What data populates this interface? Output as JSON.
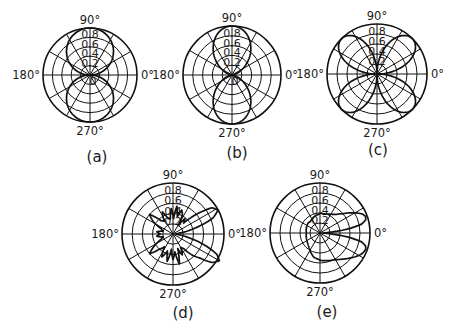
{
  "figure": {
    "panels": [
      "(a)",
      "(b)",
      "(c)",
      "(d)",
      "(e)"
    ]
  },
  "chart_data": [
    {
      "type": "polar-line",
      "caption": "(a)",
      "pattern": "dipole |sin θ| (two tangent circles, lobes at 90° and 270°)",
      "angle_ticks": [
        "0°",
        "90°",
        "180°",
        "270°"
      ],
      "radial_ticks": [
        0.2,
        0.4,
        0.6,
        0.8
      ],
      "center_label": "0",
      "rmax": 1.0,
      "grid": {
        "rings": [
          0.2,
          0.4,
          0.6,
          0.8,
          1.0
        ],
        "spokes_deg": 30
      },
      "layout": {
        "cx": 90,
        "cy": 75,
        "r": 47,
        "caption_x": 97,
        "caption_y": 162
      },
      "func": "abs_sin",
      "samples": {
        "theta_deg": [
          0,
          30,
          60,
          90,
          120,
          150,
          180,
          210,
          240,
          270,
          300,
          330
        ],
        "r": [
          0,
          0.5,
          0.87,
          1.0,
          0.87,
          0.5,
          0,
          0.5,
          0.87,
          1.0,
          0.87,
          0.5
        ]
      }
    },
    {
      "type": "polar-line",
      "caption": "(b)",
      "pattern": "dipole sin²θ (narrower lobes at 90° and 270°)",
      "angle_ticks": [
        "0°",
        "90°",
        "180°",
        "270°"
      ],
      "radial_ticks": [
        0.2,
        0.4,
        0.6,
        0.8
      ],
      "center_label": "0",
      "rmax": 1.0,
      "grid": {
        "rings": [
          0.2,
          0.4,
          0.6,
          0.8,
          1.0
        ],
        "spokes_deg": 30
      },
      "layout": {
        "cx": 232,
        "cy": 75,
        "r": 49,
        "caption_x": 237,
        "caption_y": 158
      },
      "func": "sin_sq",
      "samples": {
        "theta_deg": [
          0,
          30,
          60,
          90,
          120,
          150,
          180,
          210,
          240,
          270,
          300,
          330
        ],
        "r": [
          0,
          0.25,
          0.75,
          1.0,
          0.75,
          0.25,
          0,
          0.25,
          0.75,
          1.0,
          0.75,
          0.25
        ]
      }
    },
    {
      "type": "polar-line",
      "caption": "(c)",
      "pattern": "quadrupole |sin 2θ| (four lobes at 45°, 135°, 225°, 315°)",
      "angle_ticks": [
        "0°",
        "90°",
        "180°",
        "270°"
      ],
      "radial_ticks": [
        0.2,
        0.4,
        0.6,
        0.8
      ],
      "rmax": 1.0,
      "grid": {
        "rings": [
          0.2,
          0.4,
          0.6,
          0.8,
          1.0
        ],
        "spokes_deg": 30
      },
      "layout": {
        "cx": 377,
        "cy": 74,
        "r": 50,
        "caption_x": 378,
        "caption_y": 155
      },
      "func": "abs_sin2",
      "samples": {
        "theta_deg": [
          0,
          45,
          90,
          135,
          180,
          225,
          270,
          315
        ],
        "r": [
          0,
          1.0,
          0,
          1.0,
          0,
          1.0,
          0,
          1.0
        ]
      }
    },
    {
      "type": "polar-line",
      "caption": "(d)",
      "pattern": "two main lobes at about ±30°, spiky back sidelobes",
      "angle_ticks": [
        "0°",
        "90°",
        "180°",
        "270°"
      ],
      "radial_ticks": [
        0.2,
        0.4,
        0.6,
        0.8
      ],
      "rmax": 1.0,
      "grid": {
        "rings": [
          0.2,
          0.4,
          0.6,
          0.8,
          1.0
        ],
        "spokes_deg": 30
      },
      "layout": {
        "cx": 173,
        "cy": 234,
        "r": 51,
        "caption_x": 183,
        "caption_y": 318
      },
      "func": "points",
      "samples": {
        "theta_deg": [
          0,
          8,
          15,
          22,
          28,
          34,
          40,
          46,
          52,
          58,
          64,
          70,
          76,
          82,
          88,
          94,
          100,
          108,
          116,
          124,
          132,
          140,
          148,
          156,
          164,
          172,
          180,
          188,
          196,
          204,
          212,
          220,
          228,
          236,
          244,
          252,
          258,
          264,
          270,
          276,
          282,
          288,
          294,
          300,
          306,
          312,
          318,
          324,
          330,
          335,
          340,
          346,
          352,
          360
        ],
        "r": [
          0.05,
          0.12,
          0.45,
          0.85,
          1.0,
          0.92,
          0.6,
          0.3,
          0.38,
          0.2,
          0.42,
          0.5,
          0.35,
          0.55,
          0.3,
          0.5,
          0.3,
          0.32,
          0.48,
          0.3,
          0.35,
          0.6,
          0.45,
          0.25,
          0.2,
          0.32,
          0.25,
          0.32,
          0.2,
          0.25,
          0.42,
          0.6,
          0.4,
          0.3,
          0.5,
          0.35,
          0.55,
          0.3,
          0.5,
          0.35,
          0.6,
          0.3,
          0.45,
          0.3,
          0.35,
          0.55,
          0.7,
          0.95,
          1.05,
          0.95,
          0.7,
          0.35,
          0.12,
          0.05
        ]
      }
    },
    {
      "type": "polar-line",
      "caption": "(e)",
      "pattern": "two forward lobes at about ±20°, broad low back plateau",
      "angle_ticks": [
        "0°",
        "90°",
        "180°",
        "270°"
      ],
      "radial_ticks": [
        0.2,
        0.4,
        0.6,
        0.8
      ],
      "rmax": 1.0,
      "grid": {
        "rings": [
          0.2,
          0.4,
          0.6,
          0.8,
          1.0
        ],
        "spokes_deg": 30
      },
      "layout": {
        "cx": 320,
        "cy": 233,
        "r": 50,
        "caption_x": 327,
        "caption_y": 317
      },
      "func": "points",
      "samples": {
        "theta_deg": [
          0,
          4,
          8,
          12,
          16,
          20,
          24,
          28,
          34,
          40,
          48,
          56,
          64,
          72,
          80,
          88,
          96,
          104,
          112,
          120,
          130,
          140,
          150,
          160,
          170,
          180,
          190,
          200,
          210,
          220,
          230,
          240,
          248,
          256,
          264,
          272,
          280,
          288,
          296,
          304,
          312,
          320,
          326,
          332,
          336,
          340,
          344,
          348,
          352,
          356,
          360
        ],
        "r": [
          0.05,
          0.15,
          0.55,
          0.85,
          0.95,
          0.97,
          0.93,
          0.85,
          0.72,
          0.6,
          0.5,
          0.45,
          0.42,
          0.4,
          0.38,
          0.4,
          0.37,
          0.36,
          0.34,
          0.32,
          0.3,
          0.31,
          0.3,
          0.29,
          0.28,
          0.27,
          0.28,
          0.29,
          0.3,
          0.32,
          0.35,
          0.4,
          0.45,
          0.5,
          0.52,
          0.55,
          0.56,
          0.58,
          0.6,
          0.64,
          0.7,
          0.78,
          0.85,
          0.92,
          0.95,
          0.97,
          0.95,
          0.85,
          0.55,
          0.15,
          0.05
        ]
      }
    }
  ]
}
